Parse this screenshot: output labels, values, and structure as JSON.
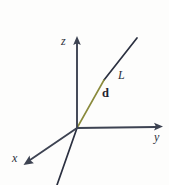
{
  "figure": {
    "background_color": "#fdfdfc",
    "width": 169,
    "height": 185,
    "labels": {
      "z_axis": "z",
      "y_axis": "y",
      "x_axis": "x",
      "line": "L",
      "direction_vector": "d"
    },
    "colors": {
      "axis": "#3d4352",
      "line": "#2b3040",
      "vector": "#8a8a3c"
    },
    "origin": {
      "x": 77,
      "y": 128
    },
    "axes": [
      {
        "name": "z-axis",
        "label": "z",
        "from": {
          "x": 77,
          "y": 128
        },
        "to": {
          "x": 77,
          "y": 41
        },
        "arrow": true,
        "color": "#3d4352"
      },
      {
        "name": "y-axis",
        "label": "y",
        "from": {
          "x": 77,
          "y": 128
        },
        "to": {
          "x": 160,
          "y": 127
        },
        "arrow": true,
        "color": "#3d4352"
      },
      {
        "name": "x-axis",
        "label": "x",
        "from": {
          "x": 77,
          "y": 128
        },
        "to": {
          "x": 27,
          "y": 163
        },
        "arrow": true,
        "color": "#3d4352"
      }
    ],
    "line": {
      "name": "L",
      "label": "L",
      "color": "#2b3040",
      "from": {
        "x": 57,
        "y": 185
      },
      "to": {
        "x": 137,
        "y": 38
      },
      "passes_through_origin": true
    },
    "vector": {
      "name": "d",
      "label": "d",
      "color": "#8a8a3c",
      "from": {
        "x": 77,
        "y": 128
      },
      "to": {
        "x": 104,
        "y": 80
      },
      "bold": true
    }
  }
}
